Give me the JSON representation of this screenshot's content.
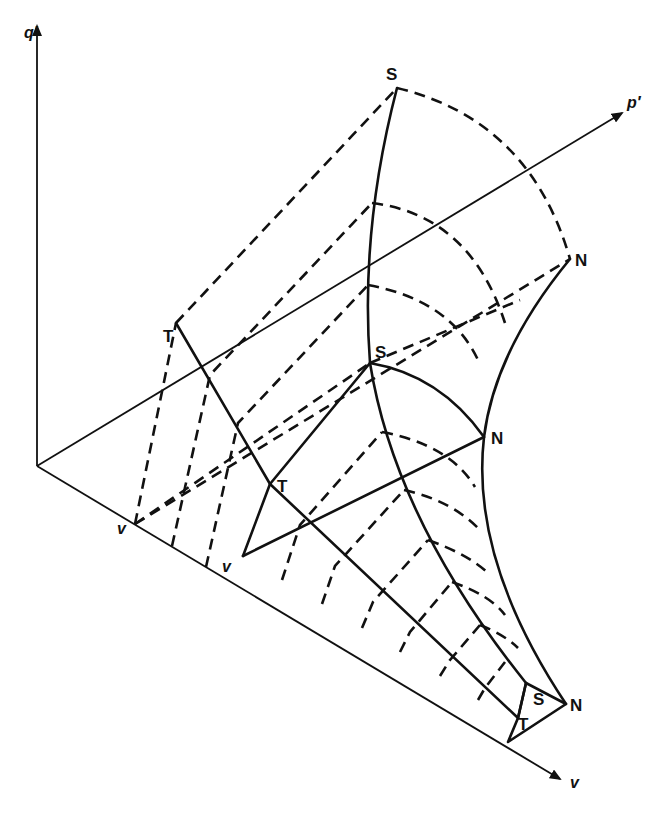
{
  "figure": {
    "axes": {
      "q_axis_label": "q′",
      "p_axis_label": "p′",
      "v_axis_label": "v"
    },
    "point_labels": {
      "s_top": "S",
      "n_top": "N",
      "t_top": "T",
      "s_mid": "S",
      "n_mid": "N",
      "t_mid": "T",
      "v_left": "v",
      "v_mid": "v",
      "s_bottom": "S",
      "n_bottom": "N",
      "t_bottom": "T"
    },
    "colors": {
      "ink": "#111111",
      "background": "#ffffff"
    }
  }
}
